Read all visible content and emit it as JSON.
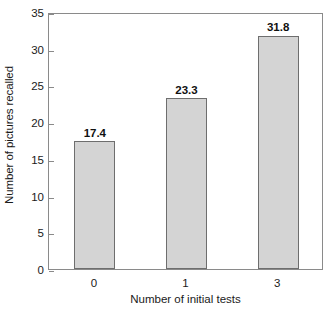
{
  "chart_data": {
    "type": "bar",
    "title": "",
    "subtitle": "",
    "xlabel": "Number of initial tests",
    "ylabel": "Number of pictures recalled",
    "categories": [
      "0",
      "1",
      "3"
    ],
    "values": [
      17.4,
      23.3,
      31.8
    ],
    "value_labels": [
      "17.4",
      "23.3",
      "31.8"
    ],
    "ylim": [
      0,
      35
    ],
    "ytick_labels": [
      "0",
      "5",
      "10",
      "15",
      "20",
      "25",
      "30",
      "35"
    ],
    "ytick_values": [
      0,
      5,
      10,
      15,
      20,
      25,
      30,
      35
    ],
    "grid": false,
    "legend": null,
    "legend_position": "none",
    "annotations": [],
    "colors": {
      "bar_fill": "#d4d4d4",
      "bar_edge": "#6e6e6e",
      "axis": "#8a8a8a",
      "text": "#1a1a1a",
      "background": "#ffffff"
    }
  }
}
